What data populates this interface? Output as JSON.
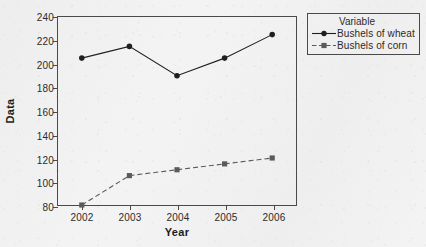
{
  "chart_data": {
    "type": "line",
    "title": "",
    "xlabel": "Year",
    "ylabel": "Data",
    "categories": [
      "2002",
      "2003",
      "2004",
      "2005",
      "2006"
    ],
    "ylim": [
      80,
      240
    ],
    "yticks": [
      "240",
      "220",
      "200",
      "180",
      "160",
      "140",
      "120",
      "100",
      "80"
    ],
    "ytick_values": [
      240,
      220,
      200,
      180,
      160,
      140,
      120,
      100,
      80
    ],
    "grid": false,
    "legend_position": "right",
    "legend_title": "Variable",
    "series": [
      {
        "name": "Bushels of wheat",
        "values": [
          205,
          215,
          190,
          205,
          225
        ],
        "line_style": "solid",
        "marker": "filled-circle",
        "color": "#1f1f1f"
      },
      {
        "name": "Bushels of corn",
        "values": [
          80,
          105,
          110,
          115,
          120
        ],
        "line_style": "dashed",
        "marker": "filled-square",
        "color": "#5a5a5a"
      }
    ]
  },
  "legend": {
    "title": "Variable",
    "entries": [
      {
        "label": "Bushels of wheat"
      },
      {
        "label": "Bushels of corn"
      }
    ]
  },
  "axes": {
    "x_title": "Year",
    "y_title": "Data"
  }
}
